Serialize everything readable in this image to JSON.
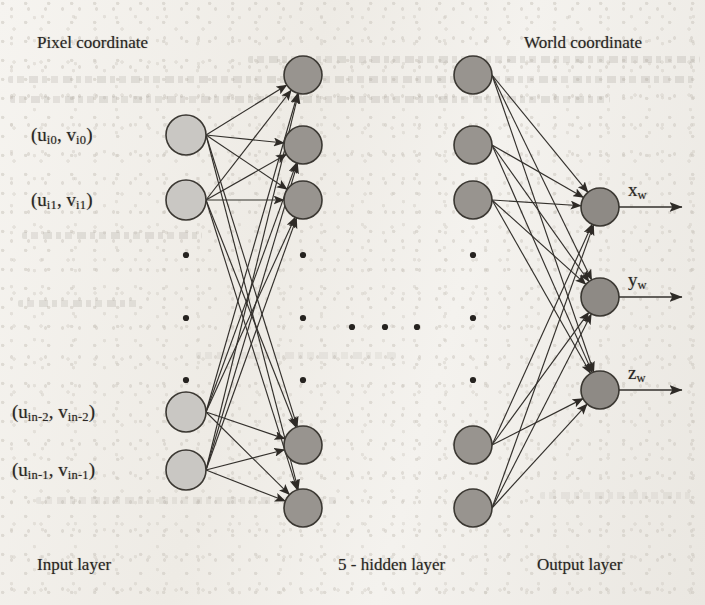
{
  "figure": {
    "type": "neural-network-diagram",
    "title_top_left": "Pixel coordinate",
    "title_top_right": "World coordinate",
    "footer_labels": {
      "input": "Input layer",
      "hidden": "5 - hidden layer",
      "output": "Output layer"
    },
    "colors": {
      "paper": "#f2f0ec",
      "input_node_fill": "#c9c7c3",
      "hidden_node_fill": "#98948f",
      "output_node_fill": "#8e8a85",
      "node_stroke": "#3b3833",
      "edge": "#33302c",
      "text": "#2a2724",
      "dot": "#262320"
    }
  },
  "input_layer": {
    "name": "Input layer",
    "node_count_visible": 4,
    "labels": [
      {
        "base_u": "u",
        "sub_u": "i0",
        "base_v": "v",
        "sub_v": "i0",
        "text": "(u_i0, v_i0)"
      },
      {
        "base_u": "u",
        "sub_u": "i1",
        "base_v": "v",
        "sub_v": "i1",
        "text": "(u_i1, v_i1)"
      },
      {
        "base_u": "u",
        "sub_u": "in-2",
        "base_v": "v",
        "sub_v": "in-2",
        "text": "(u_in-2, v_in-2)"
      },
      {
        "base_u": "u",
        "sub_u": "in-1",
        "base_v": "v",
        "sub_v": "in-1",
        "text": "(u_in-1, v_in-1)"
      }
    ],
    "ellipsis": "vertical, 3 dots"
  },
  "hidden_layers": {
    "name": "5 - hidden layer",
    "count": 5,
    "first_column_nodes_visible": 5,
    "last_column_nodes_visible": 5,
    "column_ellipsis": "horizontal, 3 dots",
    "node_ellipsis": "vertical, 3 dots"
  },
  "output_layer": {
    "name": "Output layer",
    "node_count": 3,
    "labels": [
      {
        "base": "x",
        "sub": "w",
        "text": "x_w"
      },
      {
        "base": "y",
        "sub": "w",
        "text": "y_w"
      },
      {
        "base": "z",
        "sub": "w",
        "text": "z_w"
      }
    ]
  },
  "geometry": {
    "input_x": 186,
    "hidden1_x": 303,
    "hiddenN_x": 473,
    "output_x": 600,
    "node_r_input": 20,
    "node_r_hidden": 19,
    "node_r_output": 19,
    "input_ys": [
      135,
      200,
      412,
      470
    ],
    "hidden1_ys": [
      75,
      145,
      200,
      445,
      508
    ],
    "hiddenN_ys": [
      75,
      145,
      200,
      445,
      508
    ],
    "output_ys": [
      207,
      297,
      390
    ],
    "input_dot_ys": [
      255,
      318,
      380
    ],
    "hidden1_dot_ys": [
      255,
      318,
      380
    ],
    "hiddenN_dot_ys": [
      255,
      318,
      380
    ],
    "mid_dots_x": [
      352,
      385,
      417
    ],
    "mid_dots_y": 327,
    "arrow_end_x": 682
  }
}
